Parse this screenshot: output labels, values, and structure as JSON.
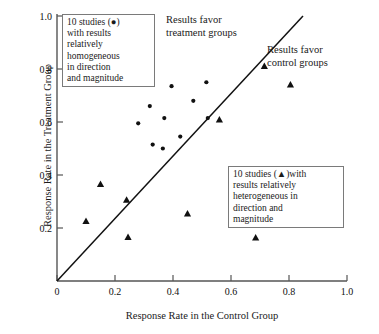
{
  "chart_data": {
    "type": "scatter",
    "title": "",
    "xlabel": "Response Rate in the Control Group",
    "ylabel": "Response Rate in the Treatment Group",
    "xlim": [
      0,
      1.0
    ],
    "ylim": [
      0,
      1.0
    ],
    "xticks": [
      "0",
      "0.2",
      "0.4",
      "0.6",
      "0.8",
      "1.0"
    ],
    "xtick_values": [
      0,
      0.2,
      0.4,
      0.6,
      0.8,
      1.0
    ],
    "yticks": [
      "0.2",
      "0.4",
      "0.6",
      "0.8",
      "1.0"
    ],
    "ytick_values": [
      0.2,
      0.4,
      0.6,
      0.8,
      1.0
    ],
    "grid": false,
    "reference_line": {
      "name": "line-of-equality",
      "from": [
        0,
        0
      ],
      "to": [
        0.85,
        0.85
      ],
      "description": "45-degree line of equality"
    },
    "series": [
      {
        "name": "10 studies with results relatively homogeneous in direction and magnitude",
        "marker": "circle",
        "color": "#111111",
        "points": [
          [
            0.28,
            0.595
          ],
          [
            0.32,
            0.66
          ],
          [
            0.33,
            0.515
          ],
          [
            0.365,
            0.5
          ],
          [
            0.37,
            0.615
          ],
          [
            0.395,
            0.735
          ],
          [
            0.425,
            0.545
          ],
          [
            0.47,
            0.68
          ],
          [
            0.515,
            0.75
          ],
          [
            0.52,
            0.615
          ]
        ]
      },
      {
        "name": "10 studies with results relatively heterogeneous in direction and magnitude",
        "marker": "triangle",
        "color": "#111111",
        "points": [
          [
            0.1,
            0.225
          ],
          [
            0.15,
            0.365
          ],
          [
            0.24,
            0.305
          ],
          [
            0.245,
            0.165
          ],
          [
            0.45,
            0.253
          ],
          [
            0.56,
            0.608
          ],
          [
            0.65,
            0.378
          ],
          [
            0.685,
            0.163
          ],
          [
            0.715,
            0.81
          ],
          [
            0.805,
            0.74
          ]
        ]
      }
    ]
  },
  "legend": {
    "homogeneous": {
      "lines": [
        "10 studies (●)",
        "with results",
        "relatively",
        "homogeneous",
        "in direction",
        "and magnitude"
      ]
    },
    "heterogeneous": {
      "lines": [
        "10 studies (▲)with",
        "results relatively",
        "heterogeneous in",
        "direction and",
        "magnitude"
      ]
    }
  },
  "annotations": {
    "treatment": {
      "lines": [
        "Results favor",
        "treatment groups"
      ]
    },
    "control": {
      "lines": [
        "Results favor",
        "control groups"
      ]
    }
  },
  "colors": {
    "axis": "#555555",
    "marker": "#111111",
    "legend_border": "#7a7a7a",
    "text": "#111111",
    "background": "#ffffff"
  }
}
